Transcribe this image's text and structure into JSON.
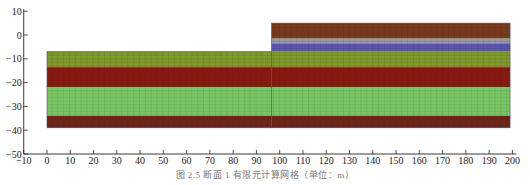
{
  "chart_data": {
    "type": "diagram",
    "title": "",
    "caption": "图 2.5  断面 1 有限元计算网格（单位：m）",
    "x_axis": {
      "min": -10,
      "max": 200,
      "ticks": [
        -10,
        0,
        10,
        20,
        30,
        40,
        50,
        60,
        70,
        80,
        90,
        100,
        110,
        120,
        130,
        140,
        150,
        160,
        170,
        180,
        190,
        200
      ]
    },
    "y_axis": {
      "min": -50,
      "max": 10,
      "ticks": [
        10,
        0,
        -10,
        -20,
        -30,
        -40,
        -50
      ]
    },
    "grid_mesh": true,
    "blocks": [
      {
        "name": "left-block",
        "x_range": [
          0,
          96.5
        ],
        "layers": [
          {
            "name": "olive-layer",
            "top": -7,
            "bottom": -13.5,
            "color": "#7e9a2a"
          },
          {
            "name": "red-layer",
            "top": -13.5,
            "bottom": -22,
            "color": "#8a1a10"
          },
          {
            "name": "light-green-layer",
            "top": -22,
            "bottom": -34,
            "color": "#79c764"
          },
          {
            "name": "dark-red-layer",
            "top": -34,
            "bottom": -39,
            "color": "#6e2416"
          }
        ]
      },
      {
        "name": "right-block",
        "x_range": [
          96.5,
          199
        ],
        "layers": [
          {
            "name": "brown-layer",
            "top": 5,
            "bottom": -1.5,
            "color": "#7a3a1c"
          },
          {
            "name": "gray-layer",
            "top": -1.5,
            "bottom": -3.5,
            "color": "#9a9a98"
          },
          {
            "name": "blue-layer",
            "top": -3.5,
            "bottom": -7,
            "color": "#5a55b0"
          },
          {
            "name": "olive-layer",
            "top": -7,
            "bottom": -13.5,
            "color": "#7e9a2a"
          },
          {
            "name": "red-layer",
            "top": -13.5,
            "bottom": -22,
            "color": "#8a1a10"
          },
          {
            "name": "light-green-layer",
            "top": -22,
            "bottom": -34,
            "color": "#79c764"
          },
          {
            "name": "dark-red-layer",
            "top": -34,
            "bottom": -39,
            "color": "#6e2416"
          }
        ]
      }
    ]
  },
  "caption": "图 2.5  断面 1 有限元计算网格（单位：m）"
}
